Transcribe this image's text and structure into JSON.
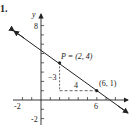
{
  "problem_number": "1.",
  "axes": {
    "x_label": "x",
    "y_label": "y",
    "x_ticks_labeled": [
      "-2",
      "6"
    ],
    "y_ticks_labeled": [
      "8",
      "-2"
    ]
  },
  "points": [
    {
      "name": "P",
      "label": "P = (2, 4)",
      "x": 2,
      "y": 4
    },
    {
      "name": "Q",
      "label": "(6, 1)",
      "x": 6,
      "y": 1
    }
  ],
  "slope_triangle": {
    "rise_label": "−3",
    "run_label": "4"
  },
  "line": {
    "slope": "-3/4",
    "through": [
      "(2,4)",
      "(6,1)"
    ]
  },
  "colors": {
    "ink": "#222222",
    "background": "#ffffff"
  }
}
